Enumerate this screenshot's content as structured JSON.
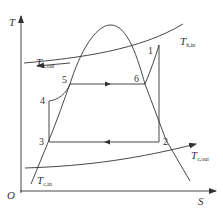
{
  "diagram": {
    "type": "T-S diagram",
    "axes": {
      "y_label": "T",
      "x_label": "S",
      "origin_label": "O"
    },
    "streams": {
      "hot_in": {
        "symbol": "T",
        "subscript": "h,in"
      },
      "hot_out": {
        "symbol": "T",
        "subscript": "h,out"
      },
      "cold_in": {
        "symbol": "T",
        "subscript": "c,in"
      },
      "cold_out": {
        "symbol": "T",
        "subscript": "c,out"
      }
    },
    "points": [
      "1",
      "2",
      "3",
      "4",
      "5",
      "6"
    ],
    "colors": {
      "line": "#333333",
      "background": "#ffffff"
    }
  }
}
